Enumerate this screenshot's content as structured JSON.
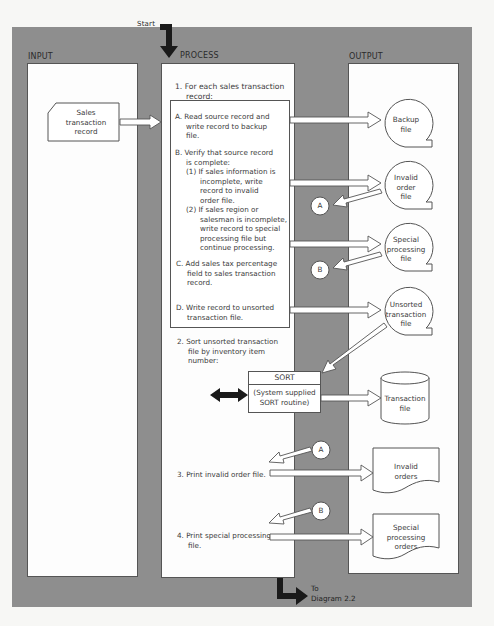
{
  "columns": {
    "input": "INPUT",
    "process": "PROCESS",
    "output": "OUTPUT"
  },
  "start_label": "Start",
  "end_label": [
    "To",
    "Diagram 2.2"
  ],
  "input": {
    "source_document": [
      "Sales",
      "transaction",
      "record"
    ]
  },
  "process": {
    "step1": [
      "1.  For each sales transaction",
      "record:"
    ],
    "substeps": {
      "A": [
        "A.  Read source record and",
        "write record to backup",
        "file."
      ],
      "B": [
        "B.  Verify that source record",
        "is complete:"
      ],
      "B1": [
        "(1)  If sales information is",
        "incomplete, write",
        "record to invalid",
        "order file."
      ],
      "B2": [
        "(2)  If sales region or",
        "salesman is incomplete,",
        "write record to special",
        "processing file but",
        "continue processing."
      ],
      "C": [
        "C.  Add sales tax percentage",
        "field to sales transaction",
        "record."
      ],
      "D": [
        "D.  Write record to unsorted",
        "transaction file."
      ]
    },
    "step2": [
      "2.  Sort unsorted transaction",
      "file by inventory item",
      "number:"
    ],
    "sort_box": {
      "title": "SORT",
      "body": [
        "(System supplied",
        "SORT routine)"
      ]
    },
    "step3": "3.  Print invalid order file.",
    "step4": [
      "4.  Print special processing",
      "file."
    ]
  },
  "output": {
    "backup_file": [
      "Backup",
      "file"
    ],
    "invalid_order_file": [
      "Invalid",
      "order",
      "file"
    ],
    "special_processing_file": [
      "Special",
      "processing",
      "file"
    ],
    "unsorted_transaction_file": [
      "Unsorted",
      "transaction",
      "file"
    ],
    "transaction_file": [
      "Transaction",
      "file"
    ],
    "invalid_orders": [
      "Invalid",
      "orders"
    ],
    "special_processing_orders": [
      "Special",
      "processing",
      "orders"
    ]
  },
  "connectors": {
    "A": "A",
    "B": "B"
  },
  "colors": {
    "panel": "#8e8e8e",
    "column": "#fdfdfd",
    "stroke": "#555555",
    "arrow_fill": "#1a1a1a"
  }
}
